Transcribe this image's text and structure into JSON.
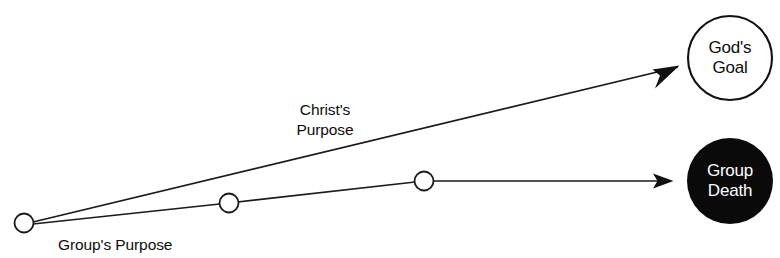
{
  "diagram": {
    "background_color": "#ffffff",
    "stroke_color": "#1a1a1a",
    "nodes": {
      "origin": {
        "name": "origin-waypoint",
        "cx": 24,
        "cy": 223,
        "r": 9.5
      },
      "waypoint_1": {
        "name": "group-purpose-waypoint-1",
        "cx": 229,
        "cy": 203,
        "r": 9.5
      },
      "waypoint_2": {
        "name": "group-purpose-waypoint-2",
        "cx": 424,
        "cy": 181,
        "r": 9.5
      },
      "gods_goal": {
        "label_line_1": "God's",
        "label_line_2": "Goal",
        "cx": 730,
        "cy": 58,
        "r": 42,
        "fill": "#ffffff",
        "stroke": "#111111",
        "text_color": "#0d0d0d"
      },
      "group_death": {
        "label_line_1": "Group",
        "label_line_2": "Death",
        "cx": 730,
        "cy": 181,
        "r": 43,
        "fill": "#0a0a0a",
        "stroke": "none",
        "text_color": "#ffffff"
      }
    },
    "edges": {
      "christs_purpose": {
        "label_line_1": "Christ's",
        "label_line_2": "Purpose",
        "path": "M 33 222 L 678 67",
        "arrow_style": "barbed",
        "target": "God's Goal"
      },
      "groups_purpose": {
        "label": "Group's Purpose",
        "path": "M 33 224 L 229 203 L 424 181 L 670 181",
        "arrow_style": "solid",
        "target": "Group Death"
      }
    }
  }
}
